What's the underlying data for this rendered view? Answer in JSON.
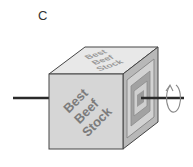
{
  "panel": {
    "label": "C"
  },
  "cube": {
    "front_text": [
      "Best",
      "Beef",
      "Stock"
    ],
    "top_text": [
      "Best",
      "Beef",
      "Stock"
    ],
    "colors": {
      "front_face": "#d6d6d6",
      "top_face": "#e8e8e8",
      "right_face": "#b8b8b8",
      "edge": "#444444",
      "front_text": "#7c7c7c",
      "top_text": "#9a9a9a",
      "right_outer_band": "#a2a2a2",
      "right_inner_band": "#cfcfcf",
      "right_core": "#9a9a9a",
      "axle": "#2a2a2a",
      "rotation_arrow": "#888888"
    }
  },
  "axle": {
    "left_icon": "axle-left",
    "right_icon": "axle-right"
  },
  "rotation": {
    "icon": "rotation-arrow-icon"
  }
}
